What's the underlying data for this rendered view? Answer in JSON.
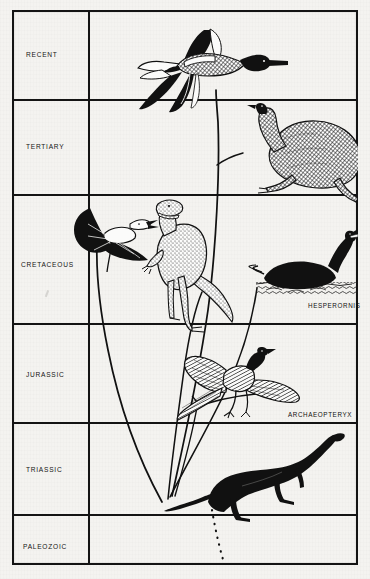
{
  "figure": {
    "type": "evolutionary-timeline-diagram",
    "title": "",
    "background_color": "#f4f3f0",
    "ink_color": "#111111",
    "border": {
      "outer": true,
      "color": "#141414"
    }
  },
  "axis": {
    "orientation": "vertical",
    "direction": "oldest-at-bottom",
    "label_column_width_px": 77
  },
  "rows": [
    {
      "id": "recent",
      "label": "RECENT",
      "top": 0,
      "bottom": 90,
      "label_y": 40
    },
    {
      "id": "tertiary",
      "label": "TERTIARY",
      "top": 90,
      "bottom": 185,
      "label_y": 132
    },
    {
      "id": "cretaceous",
      "label": "CRETACEOUS",
      "top": 185,
      "bottom": 314,
      "label_y": 250
    },
    {
      "id": "jurassic",
      "label": "JURASSIC",
      "top": 314,
      "bottom": 413,
      "label_y": 360
    },
    {
      "id": "triassic",
      "label": "TRIASSIC",
      "top": 413,
      "bottom": 505,
      "label_y": 455
    },
    {
      "id": "paleozoic",
      "label": "PALEOZOIC",
      "top": 505,
      "bottom": 555,
      "label_y": 532
    }
  ],
  "taxon_labels": [
    {
      "id": "hesperornis",
      "text": "HESPERORNIS",
      "x": 296,
      "y": 295,
      "row": "cretaceous"
    },
    {
      "id": "archaeopteryx",
      "text": "ARCHAEOPTERYX",
      "x": 276,
      "y": 404,
      "row": "jurassic"
    }
  ],
  "illustrations": [
    {
      "id": "flying-duck",
      "name": "modern-flying-bird",
      "row": "recent",
      "caption": ""
    },
    {
      "id": "moa",
      "name": "flightless-ratite",
      "row": "tertiary",
      "caption": ""
    },
    {
      "id": "pteranodon",
      "name": "pterosaur",
      "row": "cretaceous",
      "caption": ""
    },
    {
      "id": "tyrannosaur",
      "name": "theropod-dinosaur",
      "row": "cretaceous",
      "caption": ""
    },
    {
      "id": "hesperornis-bird",
      "name": "swimming-toothed-bird",
      "row": "cretaceous",
      "caption": "HESPERORNIS"
    },
    {
      "id": "archaeopteryx-bird",
      "name": "primitive-bird",
      "row": "jurassic",
      "caption": "ARCHAEOPTERYX"
    },
    {
      "id": "prosauropod",
      "name": "ancestral-archosaur",
      "row": "triassic",
      "caption": ""
    }
  ],
  "lineage_lines": [
    {
      "id": "main-stem",
      "from": "prosauropod",
      "to": "flying-duck",
      "style": "solid"
    },
    {
      "id": "branch-moa",
      "from": "main-stem",
      "to": "moa",
      "style": "solid"
    },
    {
      "id": "branch-hesperornis",
      "from": "prosauropod",
      "to": "hesperornis-bird",
      "style": "solid"
    },
    {
      "id": "branch-pterosaur",
      "from": "prosauropod",
      "to": "pteranodon",
      "style": "solid"
    },
    {
      "id": "branch-theropod",
      "from": "prosauropod",
      "to": "tyrannosaur",
      "style": "solid"
    },
    {
      "id": "root-dotted",
      "from": "prosauropod",
      "to": "paleozoic",
      "style": "dotted"
    }
  ]
}
